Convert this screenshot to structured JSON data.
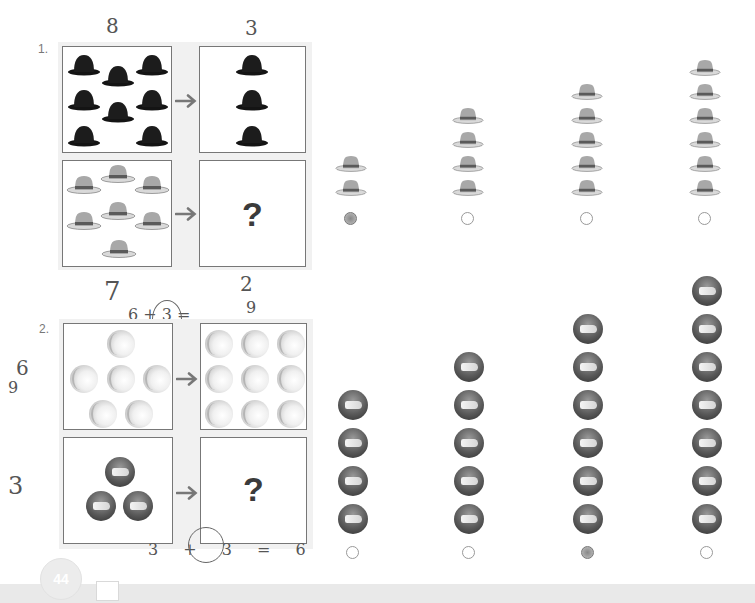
{
  "page": {
    "number": "44",
    "colors": {
      "panel": "#f1f1f1",
      "box_border": "#777777",
      "footer": "#e9e9e9",
      "bowler": "#141414",
      "fedora": "#a8a8a8"
    }
  },
  "problems": [
    {
      "number": "1.",
      "top_left": {
        "item": "bowler-hat",
        "count": 8
      },
      "top_right": {
        "item": "bowler-hat",
        "count": 3
      },
      "bottom_left": {
        "item": "fedora-hat",
        "count": 7
      },
      "bottom_right": {
        "label": "?"
      },
      "options": [
        {
          "item": "fedora-hat",
          "count": 2,
          "selected": true
        },
        {
          "item": "fedora-hat",
          "count": 4,
          "selected": false
        },
        {
          "item": "fedora-hat",
          "count": 5,
          "selected": false
        },
        {
          "item": "fedora-hat",
          "count": 6,
          "selected": false
        }
      ],
      "annotations": {
        "above_left": "8",
        "above_right": "3"
      }
    },
    {
      "number": "2.",
      "top_left": {
        "item": "light-ball",
        "count": 6
      },
      "top_right": {
        "item": "light-ball",
        "count": 9
      },
      "bottom_left": {
        "item": "dark-ball",
        "count": 3
      },
      "bottom_right": {
        "label": "?"
      },
      "options": [
        {
          "item": "dark-ball",
          "count": 4,
          "selected": false
        },
        {
          "item": "dark-ball",
          "count": 5,
          "selected": false
        },
        {
          "item": "dark-ball",
          "count": 6,
          "selected": true
        },
        {
          "item": "dark-ball",
          "count": 7,
          "selected": false
        }
      ],
      "annotations": {
        "above_left": "7",
        "above_right": "2",
        "equation_top": "6 + 3 =",
        "equation_top_result": "9",
        "left_side_top": "6",
        "left_side_bottom": "9",
        "left_of_bottom": "3",
        "equation_bottom": "3 + 3 = 6"
      }
    }
  ]
}
